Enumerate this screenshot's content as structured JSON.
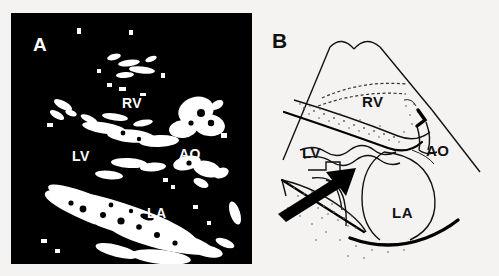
{
  "figure": {
    "type": "two-panel echocardiography figure",
    "background_color": "#f4f3f1"
  },
  "panels": [
    {
      "letter": "A",
      "name": "echocardiogram",
      "description": "Parasternal long-axis echocardiographic image, white structures on black background",
      "background_color": "#000000",
      "label_color": "#ffffff",
      "labels": [
        {
          "text": "RV",
          "meaning": "right ventricle",
          "x": 122,
          "y": 108
        },
        {
          "text": "LV",
          "meaning": "left ventricle",
          "x": 72,
          "y": 161
        },
        {
          "text": "AO",
          "meaning": "aorta",
          "x": 179,
          "y": 159
        },
        {
          "text": "LA",
          "meaning": "left atrium",
          "x": 147,
          "y": 218
        }
      ]
    },
    {
      "letter": "B",
      "name": "schematic-diagram",
      "description": "Line-drawing schematic of the same sector view with stippled tissue bands and a solid arrow indicating the dissection flap",
      "background_color": "#f4f3f1",
      "label_color": "#111111",
      "labels": [
        {
          "text": "RV",
          "meaning": "right ventricle",
          "x": 364,
          "y": 107
        },
        {
          "text": "LV",
          "meaning": "left ventricle",
          "x": 304,
          "y": 158
        },
        {
          "text": "AO",
          "meaning": "aorta",
          "x": 426,
          "y": 156
        },
        {
          "text": "LA",
          "meaning": "left atrium",
          "x": 394,
          "y": 218
        }
      ],
      "annotations": [
        {
          "name": "dissection-flap-arrow",
          "type": "arrow",
          "direction": "up-right",
          "color": "#000000"
        }
      ]
    }
  ]
}
